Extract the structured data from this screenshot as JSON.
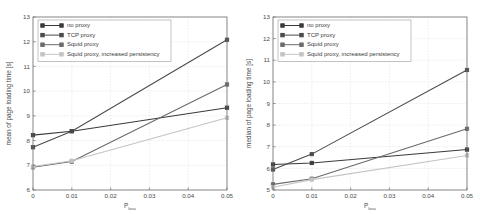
{
  "figure": {
    "background_color": "#ffffff",
    "frame_color": "#6e6e6e",
    "grid_color": "#d2d2d2"
  },
  "series_styles": {
    "no_proxy": "#3a3a3a",
    "tcp_proxy": "#4a4a4a",
    "squid_proxy": "#6a6a6a",
    "squid_proxy_persistency": "#c4c4c4"
  },
  "legend": {
    "position": "top-left",
    "entries": [
      {
        "key": "no_proxy",
        "label": "no proxy",
        "color": "#3a3a3a",
        "marker": "square"
      },
      {
        "key": "tcp_proxy",
        "label": "TCP proxy",
        "color": "#4a4a4a",
        "marker": "square"
      },
      {
        "key": "squid_proxy",
        "label": "Squid proxy",
        "color": "#6a6a6a",
        "marker": "square"
      },
      {
        "key": "squid_proxy_persistency",
        "label": "Squid proxy, increased persistency",
        "color": "#c4c4c4",
        "marker": "square"
      }
    ]
  },
  "chart_data": [
    {
      "id": "mean-plot",
      "type": "line",
      "title": "",
      "xlabel": "P",
      "xlabel_subscript": "loss",
      "ylabel": "mean of page loading time [s]",
      "x": [
        0,
        0.01,
        0.05
      ],
      "xticks": [
        0,
        0.01,
        0.02,
        0.03,
        0.04,
        0.05
      ],
      "xticklabels": [
        "0",
        "0.01",
        "0.02",
        "0.03",
        "0.04",
        "0.05"
      ],
      "xlim": [
        0,
        0.05
      ],
      "yticks": [
        6,
        7,
        8,
        9,
        10,
        11,
        12,
        13
      ],
      "yticklabels": [
        "6",
        "7",
        "8",
        "9",
        "10",
        "11",
        "12",
        "13"
      ],
      "ylim": [
        6,
        13
      ],
      "grid": true,
      "series": [
        {
          "name": "no proxy",
          "key": "no_proxy",
          "color": "#3a3a3a",
          "values": [
            8.22,
            8.38,
            9.33
          ]
        },
        {
          "name": "TCP proxy",
          "key": "tcp_proxy",
          "color": "#4a4a4a",
          "values": [
            7.73,
            8.38,
            12.08
          ]
        },
        {
          "name": "Squid proxy",
          "key": "squid_proxy",
          "color": "#6a6a6a",
          "values": [
            6.92,
            7.15,
            10.27
          ]
        },
        {
          "name": "Squid proxy, increased persistency",
          "key": "squid_proxy_persistency",
          "color": "#c4c4c4",
          "values": [
            6.95,
            7.18,
            8.92
          ]
        }
      ]
    },
    {
      "id": "median-plot",
      "type": "line",
      "title": "",
      "xlabel": "P",
      "xlabel_subscript": "loss",
      "ylabel": "median of page loading time [s]",
      "x": [
        0,
        0.01,
        0.05
      ],
      "xticks": [
        0,
        0.01,
        0.02,
        0.03,
        0.04,
        0.05
      ],
      "xticklabels": [
        "0",
        "0.01",
        "0.02",
        "0.03",
        "0.04",
        "0.05"
      ],
      "xlim": [
        0,
        0.05
      ],
      "yticks": [
        5,
        6,
        7,
        8,
        9,
        10,
        11,
        12,
        13
      ],
      "yticklabels": [
        "5",
        "6",
        "7",
        "8",
        "9",
        "10",
        "11",
        "12",
        "13"
      ],
      "ylim": [
        5,
        13
      ],
      "grid": true,
      "series": [
        {
          "name": "no proxy",
          "key": "no_proxy",
          "color": "#3a3a3a",
          "values": [
            6.18,
            6.25,
            6.87
          ]
        },
        {
          "name": "TCP proxy",
          "key": "tcp_proxy",
          "color": "#4a4a4a",
          "values": [
            5.95,
            6.66,
            10.55
          ]
        },
        {
          "name": "Squid proxy",
          "key": "squid_proxy",
          "color": "#6a6a6a",
          "values": [
            5.26,
            5.52,
            7.83
          ]
        },
        {
          "name": "Squid proxy, increased persistency",
          "key": "squid_proxy_persistency",
          "color": "#c4c4c4",
          "values": [
            5.13,
            5.48,
            6.6
          ]
        }
      ]
    }
  ]
}
